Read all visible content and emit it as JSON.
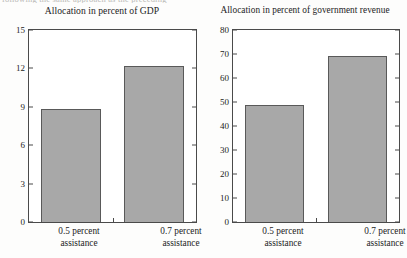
{
  "figure": {
    "cut_caption": "following the same approach as the preceding",
    "bar_color": "#a8a8a8",
    "bar_edge_color": "#595959",
    "axis_color": "#4a4a4a"
  },
  "chart_data": [
    {
      "type": "bar",
      "title": "Allocation in percent of GDP",
      "categories": [
        "0.5 percent assistance",
        "0.7 percent assistance"
      ],
      "category_lines": [
        [
          "0.5 percent",
          "assistance"
        ],
        [
          "0.7 percent",
          "assistance"
        ]
      ],
      "values": [
        8.8,
        12.2
      ],
      "xlabel": "",
      "ylabel": "",
      "ylim": [
        0,
        15
      ],
      "yticks": [
        0,
        3,
        6,
        9,
        12,
        15
      ],
      "ytick_labels": [
        "0",
        "3",
        "6",
        "9",
        "12",
        "15"
      ],
      "grid": false,
      "legend": "none"
    },
    {
      "type": "bar",
      "title": "Allocation in percent of government revenue",
      "categories": [
        "0.5 percent assistance",
        "0.7 percent assistance"
      ],
      "category_lines": [
        [
          "0.5 percent",
          "assistance"
        ],
        [
          "0.7 percent",
          "assistance"
        ]
      ],
      "values": [
        48.8,
        69.0
      ],
      "xlabel": "",
      "ylabel": "",
      "ylim": [
        0,
        80
      ],
      "yticks": [
        0,
        10,
        20,
        30,
        40,
        50,
        60,
        70,
        80
      ],
      "ytick_labels": [
        "0",
        "10",
        "20",
        "30",
        "40",
        "50",
        "60",
        "70",
        "80"
      ],
      "grid": false,
      "legend": "none"
    }
  ]
}
